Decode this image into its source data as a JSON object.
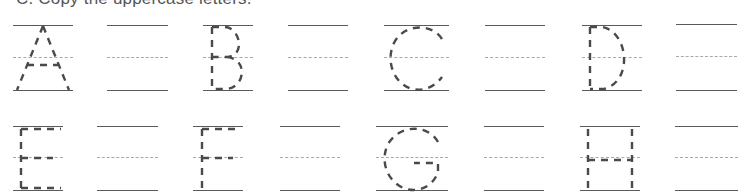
{
  "heading": "C. Copy the uppercase letters.",
  "rows": [
    {
      "cells": [
        {
          "type": "trace",
          "letter": "A"
        },
        {
          "type": "blank"
        },
        {
          "type": "trace",
          "letter": "B"
        },
        {
          "type": "blank"
        },
        {
          "type": "trace",
          "letter": "C"
        },
        {
          "type": "blank"
        },
        {
          "type": "trace",
          "letter": "D"
        },
        {
          "type": "blank"
        }
      ]
    },
    {
      "cells": [
        {
          "type": "trace",
          "letter": "E"
        },
        {
          "type": "blank"
        },
        {
          "type": "trace",
          "letter": "F"
        },
        {
          "type": "blank"
        },
        {
          "type": "trace",
          "letter": "G"
        },
        {
          "type": "blank"
        },
        {
          "type": "trace",
          "letter": "H"
        },
        {
          "type": "blank"
        }
      ]
    }
  ],
  "colors": {
    "solid_line": "#5a5a5a",
    "guide_line": "#a8a8a8",
    "trace_stroke": "#4a4a4a"
  }
}
